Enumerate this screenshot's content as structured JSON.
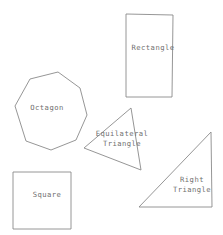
{
  "diagram": {
    "background_color": "#ffffff",
    "stroke_color": "#8a8a8a",
    "label_color": "#6f6f6f",
    "width": 223,
    "height": 235,
    "shapes": [
      {
        "id": "rectangle",
        "label": "Rectangle",
        "type": "rectangle",
        "label_x": 153,
        "label_y": 48,
        "points": "126,14 173,15 172,97 126,97"
      },
      {
        "id": "octagon",
        "label": "Octagon",
        "type": "octagon",
        "label_x": 47,
        "label_y": 108,
        "points": "30,79 58,72 80,88 87,115 76,140 51,150 26,141 15,106"
      },
      {
        "id": "equilateral-triangle",
        "label": "Equilateral\nTriangle",
        "type": "triangle",
        "label_x": 122,
        "label_y": 139,
        "points": "131,108 141,170 84,148"
      },
      {
        "id": "right-triangle",
        "label": "Right\nTriangle",
        "type": "triangle",
        "label_x": 192,
        "label_y": 185,
        "points": "211,132 212,207 139,207"
      },
      {
        "id": "square",
        "label": "Square",
        "type": "square",
        "label_x": 47,
        "label_y": 195,
        "points": "13,172 71,172 71,229 13,229"
      }
    ]
  }
}
